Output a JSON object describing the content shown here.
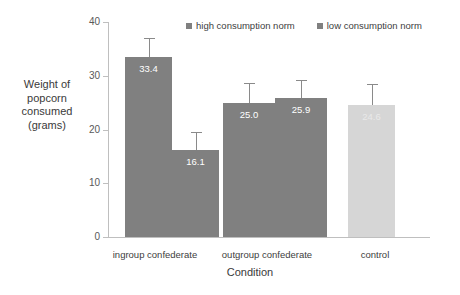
{
  "chart_data": {
    "type": "bar",
    "title": "",
    "xlabel": "Condition",
    "ylabel": "Weight of popcorn consumed (grams)",
    "ylabel_lines": [
      "Weight of",
      "popcorn",
      "consumed",
      "(grams)"
    ],
    "categories": [
      "ingroup confederate",
      "outgroup confederate",
      "control"
    ],
    "ylim": [
      0,
      40
    ],
    "yticks": [
      0,
      10,
      20,
      30,
      40
    ],
    "ytick_labels": [
      "0",
      "10",
      "20",
      "30",
      "40"
    ],
    "grid": false,
    "legend_position": "top-right",
    "series": [
      {
        "name": "high consumption norm",
        "color": "#808080",
        "values": [
          33.4,
          25.0,
          24.6
        ],
        "value_labels": [
          "33.4",
          "25.0",
          "24.6"
        ],
        "errors_upper": [
          3.7,
          3.6,
          3.9
        ]
      },
      {
        "name": "low consumption norm",
        "color": "#808080",
        "values": [
          16.1,
          25.9,
          null
        ],
        "value_labels": [
          "16.1",
          "25.9",
          ""
        ],
        "errors_upper": [
          3.5,
          3.3,
          null
        ]
      }
    ],
    "bars": [
      {
        "category": "ingroup confederate",
        "series": "high consumption norm",
        "value": 33.4,
        "label": "33.4",
        "color": "#808080",
        "err_upper": 3.7,
        "label_faint": false
      },
      {
        "category": "ingroup confederate",
        "series": "low consumption norm",
        "value": 16.1,
        "label": "16.1",
        "color": "#808080",
        "err_upper": 3.5,
        "label_faint": false
      },
      {
        "category": "outgroup confederate",
        "series": "high consumption norm",
        "value": 25.0,
        "label": "25.0",
        "color": "#808080",
        "err_upper": 3.6,
        "label_faint": false
      },
      {
        "category": "outgroup confederate",
        "series": "low consumption norm",
        "value": 25.9,
        "label": "25.9",
        "color": "#808080",
        "err_upper": 3.3,
        "label_faint": false
      },
      {
        "category": "control",
        "series": "control",
        "value": 24.6,
        "label": "24.6",
        "color": "#d6d6d6",
        "err_upper": 3.9,
        "label_faint": true
      }
    ]
  },
  "legend": {
    "items": [
      {
        "label": "high consumption norm",
        "color": "#808080"
      },
      {
        "label": "low consumption norm",
        "color": "#808080"
      }
    ]
  },
  "axes": {
    "y_title_lines": [
      "Weight of",
      "popcorn",
      "consumed",
      "(grams)"
    ],
    "x_title": "Condition",
    "y_ticks": [
      "40",
      "30",
      "20",
      "10",
      "0"
    ]
  },
  "colors": {
    "bar_dark": "#808080",
    "bar_light": "#d6d6d6",
    "axis": "#bfbfbf",
    "error": "#8a8a8a",
    "text": "#3a3a3a",
    "background": "#ffffff"
  }
}
